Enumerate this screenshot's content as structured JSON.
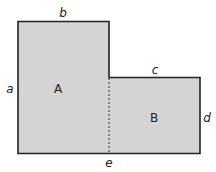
{
  "diagram": {
    "type": "composite-area-L-shape",
    "colors": {
      "fill": "#d4d4d4",
      "stroke": "#222222"
    },
    "regions": [
      {
        "id": "A",
        "label": "A"
      },
      {
        "id": "B",
        "label": "B"
      }
    ],
    "side_labels": {
      "a": "a",
      "b": "b",
      "c": "c",
      "d": "d",
      "e": "e"
    }
  }
}
